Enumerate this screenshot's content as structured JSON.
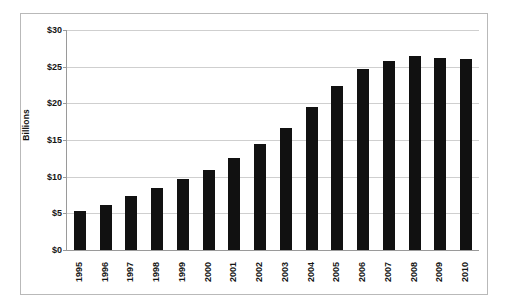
{
  "chart_data": {
    "type": "bar",
    "title": "",
    "subtitle": "",
    "xlabel": "",
    "ylabel": "Billions",
    "categories": [
      "1995",
      "1996",
      "1997",
      "1998",
      "1999",
      "2000",
      "2001",
      "2002",
      "2003",
      "2004",
      "2005",
      "2006",
      "2007",
      "2008",
      "2009",
      "2010"
    ],
    "values": [
      5.3,
      6.1,
      7.3,
      8.5,
      9.7,
      10.9,
      12.6,
      14.5,
      16.6,
      19.5,
      22.3,
      24.7,
      25.8,
      26.4,
      26.2,
      26.1
    ],
    "ylim": [
      0,
      30
    ],
    "y_tick_labels": [
      "$0",
      "$5",
      "$10",
      "$15",
      "$20",
      "$25",
      "$30"
    ],
    "y_tick_values": [
      0,
      5,
      10,
      15,
      20,
      25,
      30
    ],
    "grid": true,
    "legend": false,
    "legend_position": "none",
    "bar_color": "#111111",
    "gridline_color": "#cfcfcf",
    "axis_color": "#9a9a9a",
    "background_color": "#ffffff",
    "border_color": "#b9b9b9",
    "x_tick_rotation": -90,
    "annotations": []
  }
}
